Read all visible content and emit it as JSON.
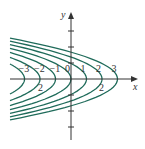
{
  "diagram": {
    "type": "contour_map",
    "axes": {
      "x_label": "x",
      "y_label": "y",
      "x_tick_label": "2",
      "x_tick_label_neg": "2"
    },
    "level_labels": [
      "−3",
      "−2",
      "−1",
      "0",
      "1",
      "2",
      "3"
    ],
    "levels": [
      -3,
      -2,
      -1,
      0,
      1,
      2,
      3
    ],
    "curve_color": "#1f6b5a",
    "axis_color": "#333333"
  }
}
